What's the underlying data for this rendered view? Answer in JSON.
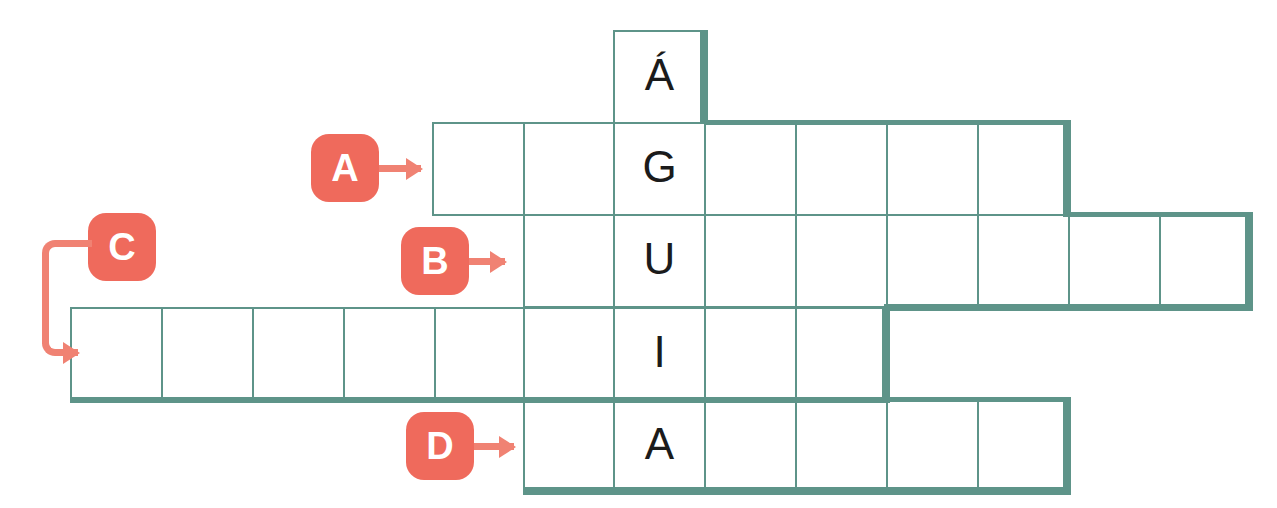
{
  "puzzle": {
    "type": "crossword-word-grid",
    "vertical_word": "ÁGUIA",
    "vertical_column_letters": [
      "Á",
      "G",
      "U",
      "I",
      "A"
    ],
    "colors": {
      "grid_line": "#5e9489",
      "grid_outline": "#5e9489",
      "marker_fill": "#ef6a5c",
      "marker_text": "#ffffff",
      "arrow": "#f08273",
      "letter": "#1b1b1b",
      "background": "#ffffff"
    },
    "geometry": {
      "cell_width": 91,
      "cell_height": 92,
      "key_column_x": 613
    },
    "rows": [
      {
        "id": "row-agulha-top",
        "clue_label": "",
        "x": 613,
        "y": 30,
        "cells": [
          {
            "letter": "Á",
            "is_key": true
          }
        ]
      },
      {
        "id": "row-a",
        "clue_label": "A",
        "x": 432,
        "y": 122,
        "cells": [
          {
            "letter": "",
            "is_key": false
          },
          {
            "letter": "",
            "is_key": false
          },
          {
            "letter": "G",
            "is_key": true
          },
          {
            "letter": "",
            "is_key": false
          },
          {
            "letter": "",
            "is_key": false
          },
          {
            "letter": "",
            "is_key": false
          },
          {
            "letter": "",
            "is_key": false
          }
        ]
      },
      {
        "id": "row-b",
        "clue_label": "B",
        "x": 513,
        "y": 214,
        "cells": [
          {
            "letter": "",
            "is_key": false
          },
          {
            "letter": "U",
            "is_key": true
          },
          {
            "letter": "",
            "is_key": false
          },
          {
            "letter": "",
            "is_key": false
          },
          {
            "letter": "",
            "is_key": false
          },
          {
            "letter": "",
            "is_key": false
          },
          {
            "letter": "",
            "is_key": false
          },
          {
            "letter": "",
            "is_key": false
          }
        ]
      },
      {
        "id": "row-c",
        "clue_label": "C",
        "x": 70,
        "y": 307,
        "cells": [
          {
            "letter": "",
            "is_key": false
          },
          {
            "letter": "",
            "is_key": false
          },
          {
            "letter": "",
            "is_key": false
          },
          {
            "letter": "",
            "is_key": false
          },
          {
            "letter": "",
            "is_key": false
          },
          {
            "letter": "",
            "is_key": false
          },
          {
            "letter": "I",
            "is_key": true
          },
          {
            "letter": "",
            "is_key": false
          },
          {
            "letter": "",
            "is_key": false
          }
        ]
      },
      {
        "id": "row-d",
        "clue_label": "D",
        "x": 523,
        "y": 399,
        "cells": [
          {
            "letter": "",
            "is_key": false
          },
          {
            "letter": "A",
            "is_key": true
          },
          {
            "letter": "",
            "is_key": false
          },
          {
            "letter": "",
            "is_key": false
          },
          {
            "letter": "",
            "is_key": false
          },
          {
            "letter": "",
            "is_key": false
          }
        ]
      }
    ],
    "markers": [
      {
        "label": "A",
        "x": 311,
        "y": 134,
        "arrow_x": 379,
        "arrow_y": 165,
        "arrow_w": 50
      },
      {
        "label": "B",
        "x": 401,
        "y": 227,
        "arrow_x": 469,
        "arrow_y": 258,
        "arrow_w": 42
      },
      {
        "label": "C",
        "x": 88,
        "y": 213,
        "arrow_x": 0,
        "arrow_y": 0,
        "arrow_w": 0
      },
      {
        "label": "D",
        "x": 406,
        "y": 412,
        "arrow_x": 474,
        "arrow_y": 443,
        "arrow_w": 46
      }
    ]
  }
}
